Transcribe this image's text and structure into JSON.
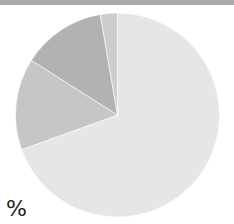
{
  "header": {
    "bar_color": "#a9a9a9"
  },
  "unit_label": "%",
  "chart_data": {
    "type": "pie",
    "title": "",
    "categories": [
      "Slice A",
      "Slice B",
      "Slice C",
      "Slice D"
    ],
    "values": [
      69.5,
      14.5,
      13.3,
      2.7
    ],
    "colors": [
      "#e6e6e6",
      "#c6c6c6",
      "#b2b2b2",
      "#cdcdcd"
    ],
    "start_angle_deg": 0,
    "direction": "clockwise",
    "legend": "none",
    "unit": "%"
  }
}
